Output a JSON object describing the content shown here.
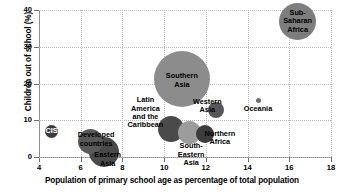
{
  "chart_data": {
    "type": "scatter",
    "title": "",
    "xlabel": "Population of primary school age as percentage of total population",
    "ylabel": "Children out of school (%)",
    "xlim": [
      4,
      18
    ],
    "ylim": [
      0,
      40
    ],
    "xticks": [
      "4",
      "6",
      "8",
      "10",
      "12",
      "14",
      "16",
      "18"
    ],
    "yticks": [
      "0",
      "10",
      "20",
      "30",
      "40"
    ],
    "grid": true,
    "legend": "none",
    "size_encoding": "bubble area proportional to number of children out of school",
    "points": [
      {
        "name": "CIS",
        "label": "CIS",
        "x": 4.6,
        "y": 6.9,
        "size": 13,
        "color": "#3c3c3c",
        "label_color": "#ffffff",
        "label_dx": 0,
        "label_dy": 0
      },
      {
        "name": "Developed countries",
        "label": "Developed\ncountries",
        "x": 6.45,
        "y": 4.2,
        "size": 25,
        "color": "#5a5a5a",
        "label_color": "#000000",
        "label_dx": 6,
        "label_dy": -2
      },
      {
        "name": "Eastern Asia",
        "label": "Eastern\nAsia",
        "x": 7.1,
        "y": 1.4,
        "size": 30,
        "color": "#4a4a4a",
        "label_color": "#000000",
        "label_dx": 4,
        "label_dy": 8
      },
      {
        "name": "Latin America and the Caribbean",
        "label": "Latin\nAmerica\nand the\nCaribbean",
        "x": 10.35,
        "y": 7.6,
        "size": 26,
        "color": "#4a4a4a",
        "label_color": "#000000",
        "label_dx": -26,
        "label_dy": -16
      },
      {
        "name": "Southern Asia",
        "label": "Southern\nAsia",
        "x": 10.85,
        "y": 21.3,
        "size": 56,
        "color": "#8c8c8c",
        "label_color": "#000000",
        "label_dx": 0,
        "label_dy": 2
      },
      {
        "name": "South-Eastern Asia",
        "label": "South-\nEastern\nAsia",
        "x": 11.2,
        "y": 6.6,
        "size": 23,
        "color": "#9c9c9c",
        "label_color": "#000000",
        "label_dx": 2,
        "label_dy": 22
      },
      {
        "name": "Northern Africa",
        "label": "Northern\nAfrica",
        "x": 11.95,
        "y": 6.2,
        "size": 18,
        "color": "#3c3c3c",
        "label_color": "#000000",
        "label_dx": 15,
        "label_dy": 4
      },
      {
        "name": "Western Asia",
        "label": "Western\nAsia",
        "x": 12.5,
        "y": 12.8,
        "size": 16,
        "color": "#575757",
        "label_color": "#000000",
        "label_dx": -9,
        "label_dy": -4
      },
      {
        "name": "Oceania",
        "label": "Oceania",
        "x": 14.5,
        "y": 15.5,
        "size": 5,
        "color": "#6e6e6e",
        "label_color": "#000000",
        "label_dx": 0,
        "label_dy": 9
      },
      {
        "name": "Sub-Saharan Africa",
        "label": "Sub-\nSaharan\nAfrica",
        "x": 16.4,
        "y": 36.9,
        "size": 37,
        "color": "#7d7d7d",
        "label_color": "#000000",
        "label_dx": 0,
        "label_dy": 0
      }
    ]
  },
  "colors": {
    "axis": "#8f8f8f",
    "grid": "#b9b9b9",
    "text": "#000000",
    "background": "#ffffff"
  }
}
